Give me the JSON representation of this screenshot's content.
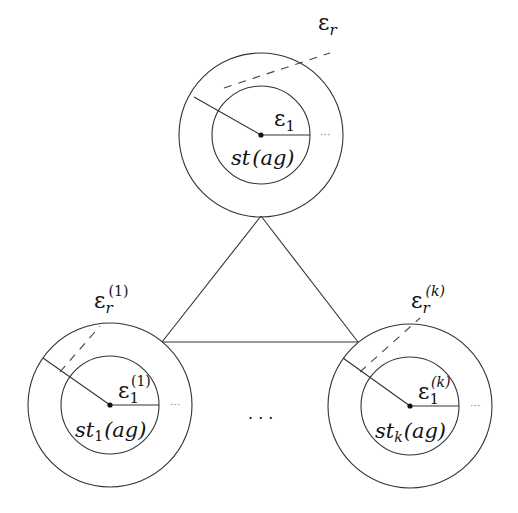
{
  "diagram": {
    "top_node": {
      "outer_label": "ε",
      "outer_sub": "r",
      "outer_sup": "",
      "inner_label": "ε",
      "inner_sub": "1",
      "inner_sup": "",
      "state_label": "st",
      "state_sub": "",
      "state_arg": "(ag)",
      "ellipsis": "···"
    },
    "left_node": {
      "outer_label": "ε",
      "outer_sub": "r",
      "outer_sup": "(1)",
      "inner_label": "ε",
      "inner_sub": "1",
      "inner_sup": "(1)",
      "state_label": "st",
      "state_sub": "1",
      "state_arg": "(ag)",
      "ellipsis": "···"
    },
    "right_node": {
      "outer_label": "ε",
      "outer_sub": "r",
      "outer_sup": "(k)",
      "inner_label": "ε",
      "inner_sub": "1",
      "inner_sup": "(k)",
      "state_label": "st",
      "state_sub": "k",
      "state_arg": "(ag)",
      "ellipsis": "···"
    },
    "between_ellipsis": "· · ·"
  }
}
